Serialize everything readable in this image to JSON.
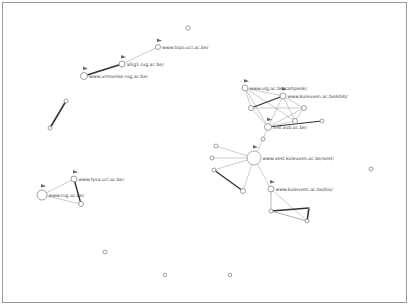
{
  "graph": {
    "nodes": [
      {
        "id": "iso1",
        "x": 188,
        "y": 28,
        "r": 2.2
      },
      {
        "id": "topo",
        "x": 158,
        "y": 47,
        "r": 2.5,
        "label": "www.topo.ucl.ac.be/",
        "flag": true
      },
      {
        "id": "allig",
        "x": 122,
        "y": 64,
        "r": 3,
        "label": "allig1.rug.ac.be/",
        "flag": true
      },
      {
        "id": "urmoelee",
        "x": 84,
        "y": 76,
        "r": 3.5,
        "label": "www.urmoelee.rug.ac.be/",
        "flag": true
      },
      {
        "id": "a1",
        "x": 66,
        "y": 101,
        "r": 2
      },
      {
        "id": "a2",
        "x": 50,
        "y": 128,
        "r": 2
      },
      {
        "id": "ulg",
        "x": 245,
        "y": 88,
        "r": 3,
        "label": "www.ulg.ac.be/campeok/",
        "flag": true
      },
      {
        "id": "kbib",
        "x": 283,
        "y": 96,
        "r": 3,
        "label": "www.kuleuven.ac.be/kbib/",
        "flag": true
      },
      {
        "id": "c1",
        "x": 251,
        "y": 108,
        "r": 2.5
      },
      {
        "id": "c2",
        "x": 304,
        "y": 108,
        "r": 2.5
      },
      {
        "id": "c3",
        "x": 295,
        "y": 121,
        "r": 2.5
      },
      {
        "id": "inst",
        "x": 268,
        "y": 127,
        "r": 3.5,
        "label": "inst.vub.ac.be/",
        "flag": true
      },
      {
        "id": "c4",
        "x": 322,
        "y": 121,
        "r": 2
      },
      {
        "id": "c5",
        "x": 263,
        "y": 139,
        "r": 2
      },
      {
        "id": "vest",
        "x": 254,
        "y": 158,
        "r": 7,
        "label": "www.vest.kuleuven.ac.be/vest/",
        "flag": true
      },
      {
        "id": "l1",
        "x": 216,
        "y": 146,
        "r": 2
      },
      {
        "id": "l2",
        "x": 212,
        "y": 158,
        "r": 2
      },
      {
        "id": "l3",
        "x": 214,
        "y": 170,
        "r": 2
      },
      {
        "id": "b1",
        "x": 243,
        "y": 191,
        "r": 2.5
      },
      {
        "id": "kbio",
        "x": 271,
        "y": 189,
        "r": 3,
        "label": "www.kuleuven.ac.be/bio/",
        "flag": true
      },
      {
        "id": "s1",
        "x": 271,
        "y": 211,
        "r": 2
      },
      {
        "id": "s2",
        "x": 307,
        "y": 221,
        "r": 2
      },
      {
        "id": "s3",
        "x": 309,
        "y": 208,
        "r": 0.8
      },
      {
        "id": "fysa",
        "x": 74,
        "y": 179,
        "r": 3,
        "label": "www.fysa.ucl.ac.be/",
        "flag": true
      },
      {
        "id": "rug",
        "x": 42,
        "y": 195,
        "r": 5,
        "label": "www.rug.ac.be/",
        "flag": true
      },
      {
        "id": "f1",
        "x": 81,
        "y": 204,
        "r": 2.5
      },
      {
        "id": "iso2",
        "x": 371,
        "y": 169,
        "r": 2
      },
      {
        "id": "iso3",
        "x": 105,
        "y": 252,
        "r": 2
      },
      {
        "id": "iso4",
        "x": 165,
        "y": 275,
        "r": 1.8
      },
      {
        "id": "iso5",
        "x": 230,
        "y": 275,
        "r": 1.8
      }
    ],
    "edges": [
      {
        "from": "topo",
        "to": "allig",
        "w": 0.5
      },
      {
        "from": "allig",
        "to": "urmoelee",
        "w": 1.6
      },
      {
        "from": "a1",
        "to": "a2",
        "w": 1.6
      },
      {
        "from": "ulg",
        "to": "kbib",
        "w": 0.5
      },
      {
        "from": "ulg",
        "to": "c1",
        "w": 0.5
      },
      {
        "from": "ulg",
        "to": "inst",
        "w": 0.5
      },
      {
        "from": "ulg",
        "to": "c3",
        "w": 0.5
      },
      {
        "from": "kbib",
        "to": "c1",
        "w": 1.3
      },
      {
        "from": "kbib",
        "to": "inst",
        "w": 0.5
      },
      {
        "from": "kbib",
        "to": "c3",
        "w": 0.5
      },
      {
        "from": "kbib",
        "to": "c2",
        "w": 0.5
      },
      {
        "from": "c1",
        "to": "c2",
        "w": 0.5
      },
      {
        "from": "c1",
        "to": "inst",
        "w": 0.5
      },
      {
        "from": "c2",
        "to": "c3",
        "w": 0.5
      },
      {
        "from": "c2",
        "to": "inst",
        "w": 0.5
      },
      {
        "from": "inst",
        "to": "c4",
        "w": 1.2
      },
      {
        "from": "inst",
        "to": "c5",
        "w": 0.5
      },
      {
        "from": "c3",
        "to": "inst",
        "w": 0.5
      },
      {
        "from": "c5",
        "to": "vest",
        "w": 0.5
      },
      {
        "from": "vest",
        "to": "l1",
        "w": 0.5
      },
      {
        "from": "vest",
        "to": "l2",
        "w": 0.5
      },
      {
        "from": "vest",
        "to": "l3",
        "w": 0.5
      },
      {
        "from": "vest",
        "to": "b1",
        "w": 0.5
      },
      {
        "from": "vest",
        "to": "kbio",
        "w": 0.5
      },
      {
        "from": "l3",
        "to": "b1",
        "w": 1.4
      },
      {
        "from": "kbio",
        "to": "s1",
        "w": 0.7
      },
      {
        "from": "kbio",
        "to": "s2",
        "w": 0.5
      },
      {
        "from": "s1",
        "to": "s3",
        "w": 1.6
      },
      {
        "from": "s3",
        "to": "s2",
        "w": 1.6
      },
      {
        "from": "s1",
        "to": "s2",
        "w": 0.8
      },
      {
        "from": "fysa",
        "to": "rug",
        "w": 0.5
      },
      {
        "from": "fysa",
        "to": "f1",
        "w": 1.4
      },
      {
        "from": "rug",
        "to": "f1",
        "w": 0.5
      }
    ]
  }
}
